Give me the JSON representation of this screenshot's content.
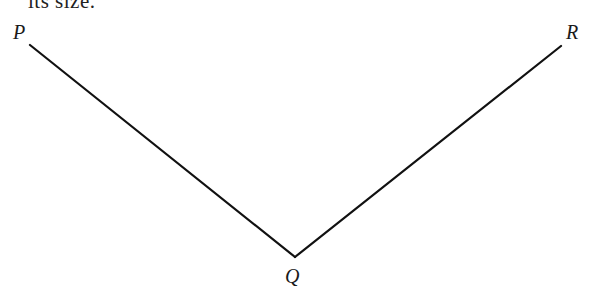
{
  "header_fragment": "its size.",
  "diagram": {
    "type": "angle",
    "points": [
      {
        "label": "P",
        "x": 30,
        "y": 45
      },
      {
        "label": "Q",
        "x": 295,
        "y": 257
      },
      {
        "label": "R",
        "x": 561,
        "y": 46
      }
    ],
    "segments": [
      [
        "P",
        "Q"
      ],
      [
        "Q",
        "R"
      ]
    ],
    "line_color": "#111111"
  },
  "labels": {
    "p": "P",
    "q": "Q",
    "r": "R"
  }
}
